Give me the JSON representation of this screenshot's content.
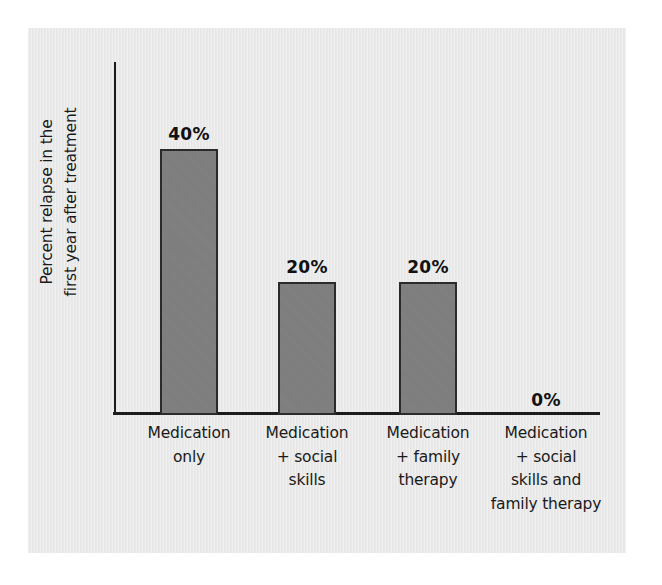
{
  "chart_data": {
    "type": "bar",
    "title": "",
    "xlabel": "",
    "ylabel": "Percent relapse in the first year after treatment",
    "ylim": [
      0,
      50
    ],
    "grid": false,
    "legend": "none",
    "categories": [
      "Medication only",
      "Medication + social skills",
      "Medication + family therapy",
      "Medication + social skills and family therapy"
    ],
    "values": [
      40,
      20,
      20,
      0
    ],
    "value_labels": [
      "40%",
      "20%",
      "20%",
      "0%"
    ],
    "units": "percent"
  },
  "axes": {
    "y_title_lines": [
      "Percent relapse in the",
      "first year after treatment"
    ]
  },
  "bars": [
    {
      "value_label": "40%",
      "category_lines": [
        "Medication",
        "only"
      ]
    },
    {
      "value_label": "20%",
      "category_lines": [
        "Medication",
        "+ social",
        "skills"
      ]
    },
    {
      "value_label": "20%",
      "category_lines": [
        "Medication",
        "+ family",
        "therapy"
      ]
    },
    {
      "value_label": "0%",
      "category_lines": [
        "Medication",
        "+ social",
        "skills and",
        "family therapy"
      ]
    }
  ],
  "colors": {
    "bar_fill": "#7e7e7e",
    "bar_outline": "#2b2b2b",
    "axis": "#1c1c1c",
    "panel_background": "#e9e9e9",
    "text": "#1a1a1a"
  }
}
